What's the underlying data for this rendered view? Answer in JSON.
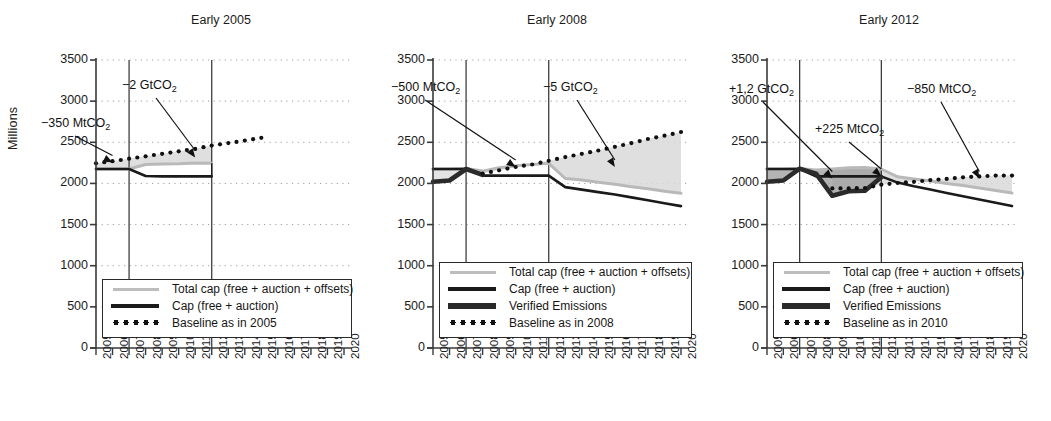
{
  "figure": {
    "ylabel": "Millions",
    "y_ticks": [
      0,
      500,
      1000,
      1500,
      2000,
      2500,
      3000,
      3500
    ],
    "x_ticks": [
      2005,
      2006,
      2007,
      2008,
      2009,
      2010,
      2011,
      2012,
      2013,
      2014,
      2015,
      2016,
      2017,
      2018,
      2019,
      2020
    ],
    "ylim": [
      0,
      3500
    ],
    "xlim": [
      2005,
      2020
    ],
    "colors": {
      "cap": "#1a1a1a",
      "total_cap": "#b9b9b9",
      "verified": "#2b2b2b",
      "baseline": "#111111",
      "band_fill": "#d9d9d9",
      "band_fill_dark": "#9a9a9a",
      "axis": "#3a3a3a",
      "grid": "#9e9e9e"
    }
  },
  "chart_data": [
    {
      "type": "line",
      "title": "Early 2005",
      "xlabel": "",
      "ylabel": "Millions",
      "ylim": [
        0,
        3500
      ],
      "xlim": [
        2005,
        2020
      ],
      "grid": "dotted-horizontal",
      "legend_position": "lower-left",
      "x": [
        2005,
        2006,
        2007,
        2008,
        2009,
        2010,
        2011,
        2012,
        2013,
        2014,
        2015,
        2016,
        2017,
        2018,
        2019,
        2020
      ],
      "series": [
        {
          "name": "Total cap (free + auction + offsets)",
          "style": "thin-light-grey-line",
          "values": [
            2175,
            2175,
            2175,
            2230,
            2235,
            2240,
            2250,
            2245,
            null,
            null,
            null,
            null,
            null,
            null,
            null,
            null
          ]
        },
        {
          "name": "Cap (free + auction)",
          "style": "thick-black-line",
          "values": [
            2175,
            2175,
            2175,
            2090,
            2085,
            2085,
            2085,
            2085,
            null,
            null,
            null,
            null,
            null,
            null,
            null,
            null
          ]
        },
        {
          "name": "Baseline as in 2005",
          "style": "black-dotted",
          "values": [
            2245,
            2270,
            2300,
            2330,
            2360,
            2390,
            2420,
            2460,
            2490,
            2520,
            2555,
            null,
            null,
            null,
            null,
            null
          ]
        }
      ],
      "phase_markers": [
        2007,
        2012
      ],
      "annotations": [
        {
          "text": "−350 MtCO₂",
          "label": "-350 MtCO2",
          "target_year": 2006,
          "target_value": 2255
        },
        {
          "text": "−2 GtCO₂",
          "label": "-2 GtCO2",
          "target_year": 2011,
          "target_value": 2315
        }
      ]
    },
    {
      "type": "line",
      "title": "Early 2008",
      "xlabel": "",
      "ylabel": "Millions",
      "ylim": [
        0,
        3500
      ],
      "xlim": [
        2005,
        2020
      ],
      "grid": "dotted-horizontal",
      "legend_position": "lower-left",
      "x": [
        2005,
        2006,
        2007,
        2008,
        2009,
        2010,
        2011,
        2012,
        2013,
        2014,
        2015,
        2016,
        2017,
        2018,
        2019,
        2020
      ],
      "series": [
        {
          "name": "Total cap (free + auction + offsets)",
          "style": "thin-light-grey-line",
          "values": [
            2175,
            2175,
            2180,
            2150,
            2190,
            2215,
            2230,
            2245,
            2060,
            2040,
            2015,
            1990,
            1960,
            1935,
            1905,
            1880
          ]
        },
        {
          "name": "Cap (free + auction)",
          "style": "thick-black-line",
          "values": [
            2175,
            2175,
            2175,
            2095,
            2095,
            2095,
            2095,
            2095,
            1955,
            1925,
            1895,
            1865,
            1830,
            1795,
            1760,
            1725
          ]
        },
        {
          "name": "Verified Emissions",
          "style": "very-thick-dark-line",
          "values": [
            2020,
            2035,
            2175,
            2105,
            null,
            null,
            null,
            null,
            null,
            null,
            null,
            null,
            null,
            null,
            null,
            null
          ]
        },
        {
          "name": "Baseline as in 2008",
          "style": "black-dotted",
          "values": [
            null,
            null,
            null,
            2120,
            2160,
            2200,
            2230,
            2275,
            2320,
            2360,
            2400,
            2445,
            2490,
            2540,
            2580,
            2625
          ]
        }
      ],
      "phase_markers": [
        2007,
        2012
      ],
      "annotations": [
        {
          "text": "−500 MtCO₂",
          "label": "-500 MtCO2",
          "target_year": 2010,
          "target_value": 2200
        },
        {
          "text": "−5 GtCO₂",
          "label": "-5 GtCO2",
          "target_year": 2016,
          "target_value": 2200
        }
      ]
    },
    {
      "type": "line",
      "title": "Early 2012",
      "xlabel": "",
      "ylabel": "Millions",
      "ylim": [
        0,
        3500
      ],
      "xlim": [
        2005,
        2020
      ],
      "grid": "dotted-horizontal",
      "legend_position": "lower-left",
      "x": [
        2005,
        2006,
        2007,
        2008,
        2009,
        2010,
        2011,
        2012,
        2013,
        2014,
        2015,
        2016,
        2017,
        2018,
        2019,
        2020
      ],
      "series": [
        {
          "name": "Total cap (free + auction + offsets)",
          "style": "thin-light-grey-line",
          "values": [
            2175,
            2175,
            2180,
            2165,
            2175,
            2190,
            2195,
            2175,
            2080,
            2055,
            2030,
            2000,
            1975,
            1945,
            1915,
            1885
          ]
        },
        {
          "name": "Cap (free + auction)",
          "style": "thick-black-line",
          "values": [
            2175,
            2175,
            2175,
            2085,
            2085,
            2085,
            2085,
            2085,
            2010,
            1965,
            1925,
            1885,
            1845,
            1805,
            1765,
            1725
          ]
        },
        {
          "name": "Verified Emissions",
          "style": "very-thick-dark-line",
          "values": [
            2020,
            2035,
            2180,
            2120,
            1850,
            1905,
            1910,
            2075,
            null,
            null,
            null,
            null,
            null,
            null,
            null,
            null
          ]
        },
        {
          "name": "Baseline as in 2010",
          "style": "black-dotted",
          "values": [
            null,
            null,
            null,
            null,
            1940,
            1940,
            1945,
            1985,
            2005,
            2020,
            2040,
            2055,
            2075,
            2085,
            2095,
            2095
          ]
        }
      ],
      "phase_markers": [
        2007,
        2012
      ],
      "annotations": [
        {
          "text": "+1,2 GtCO₂",
          "label": "+1,2 GtCO2",
          "target_year": 2009,
          "target_value": 2060
        },
        {
          "text": "+225 MtCO₂",
          "label": "+225 MtCO2",
          "target_year": 2012,
          "target_value": 2090
        },
        {
          "text": "−850 MtCO₂",
          "label": "-850 MtCO2",
          "target_year": 2018,
          "target_value": 2060
        }
      ]
    }
  ],
  "legends": [
    {
      "rows": [
        {
          "key": "total-cap",
          "label": "Total cap (free + auction + offsets)"
        },
        {
          "key": "cap",
          "label": "Cap (free + auction)"
        },
        {
          "key": "baseline",
          "label": "Baseline as in 2005"
        }
      ]
    },
    {
      "rows": [
        {
          "key": "total-cap",
          "label": "Total cap (free + auction + offsets)"
        },
        {
          "key": "cap",
          "label": "Cap (free + auction)"
        },
        {
          "key": "verified",
          "label": "Verified Emissions"
        },
        {
          "key": "baseline",
          "label": "Baseline as in 2008"
        }
      ]
    },
    {
      "rows": [
        {
          "key": "total-cap",
          "label": "Total cap (free + auction + offsets)"
        },
        {
          "key": "cap",
          "label": "Cap (free + auction)"
        },
        {
          "key": "verified",
          "label": "Verified Emissions"
        },
        {
          "key": "baseline",
          "label": "Baseline as in 2010"
        }
      ]
    }
  ]
}
